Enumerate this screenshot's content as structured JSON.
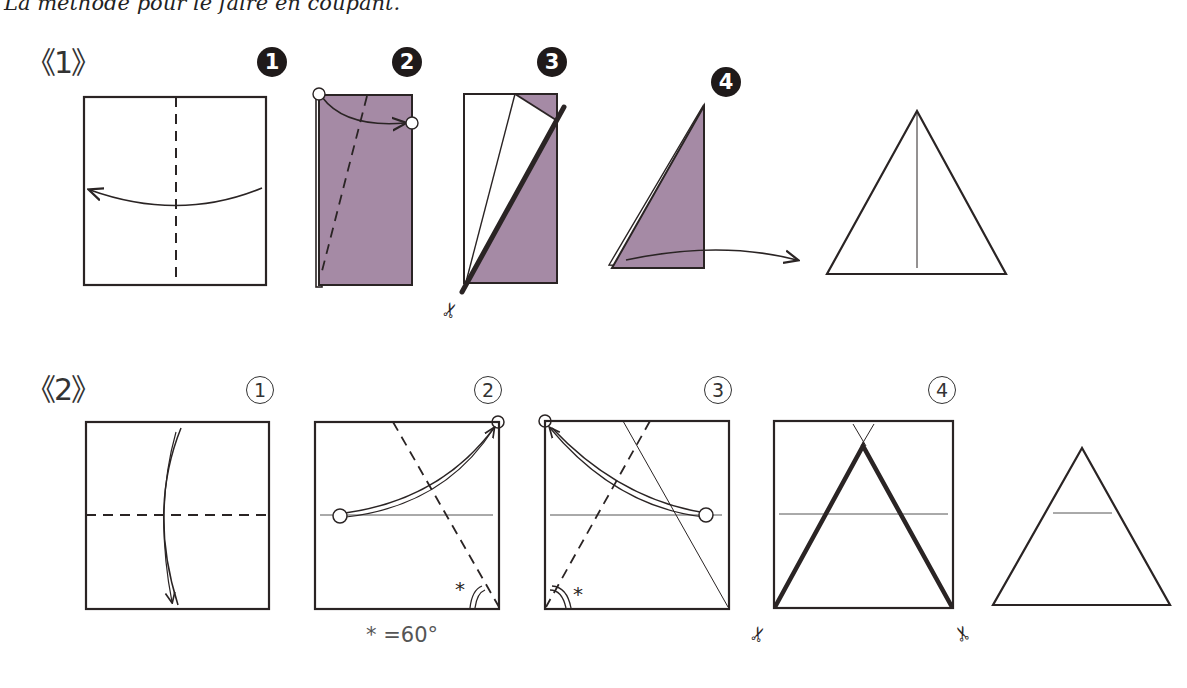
{
  "caption": "La méthode pour le faire en coupant.",
  "sections": [
    {
      "label": "《1》",
      "steps": [
        {
          "marker": "1",
          "style": "filled-circle"
        },
        {
          "marker": "2",
          "style": "filled-circle"
        },
        {
          "marker": "3",
          "style": "filled-circle"
        },
        {
          "marker": "4",
          "style": "filled-circle"
        }
      ]
    },
    {
      "label": "《2》",
      "steps": [
        {
          "marker": "1",
          "style": "outlined-circle"
        },
        {
          "marker": "2",
          "style": "outlined-circle"
        },
        {
          "marker": "3",
          "style": "outlined-circle"
        },
        {
          "marker": "4",
          "style": "outlined-circle"
        }
      ],
      "angle_note": "* =60°"
    }
  ],
  "colors": {
    "paper_purple": "#a58aa5",
    "line": "#2a2424",
    "thin_line": "#555555"
  },
  "icons": [
    "scissors-icon",
    "fold-arrow-icon",
    "angle-mark-icon"
  ]
}
